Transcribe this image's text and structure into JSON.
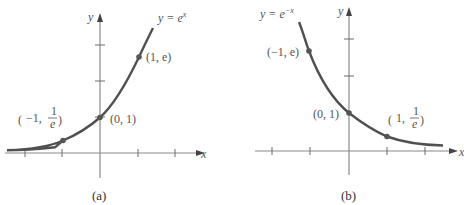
{
  "panels": [
    {
      "id": "a",
      "caption": "(a)",
      "function_label": "y = e^x",
      "function_label_base": "y = e",
      "function_label_exp": "x",
      "x_axis_label": "x",
      "y_axis_label": "y",
      "points": [
        {
          "label": "(−1, 1/e)",
          "x": -1,
          "y": 0.3679
        },
        {
          "label": "(0, 1)",
          "x": 0,
          "y": 1
        },
        {
          "label": "(1, e)",
          "x": 1,
          "y": 2.718
        }
      ],
      "point_labels": {
        "p_neg": {
          "pre": "−1,",
          "num": "1",
          "den": "e"
        },
        "p_zero": "(0, 1)",
        "p_pos": "(1, e)"
      }
    },
    {
      "id": "b",
      "caption": "(b)",
      "function_label": "y = e^−x",
      "function_label_base": "y = e",
      "function_label_exp": "−x",
      "x_axis_label": "x",
      "y_axis_label": "y",
      "points": [
        {
          "label": "(−1, e)",
          "x": -1,
          "y": 2.718
        },
        {
          "label": "(0, 1)",
          "x": 0,
          "y": 1
        },
        {
          "label": "(1, 1/e)",
          "x": 1,
          "y": 0.3679
        }
      ],
      "point_labels": {
        "p_neg": "(−1, e)",
        "p_zero": "(0, 1)",
        "p_pos": {
          "pre": "1,",
          "num": "1",
          "den": "e"
        }
      }
    }
  ],
  "colors": {
    "curve": "#505050",
    "axis": "#8a8a8a",
    "text": "#555555"
  }
}
